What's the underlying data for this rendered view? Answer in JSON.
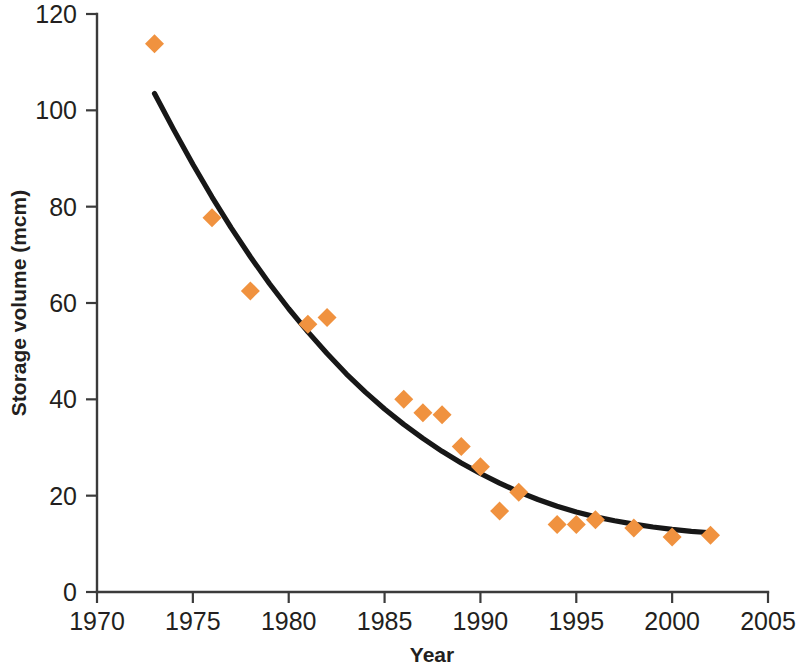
{
  "chart_data": {
    "type": "scatter",
    "title": "",
    "xlabel": "Year",
    "ylabel": "Storage volume (mcm)",
    "xlim": [
      1970,
      2005
    ],
    "ylim": [
      0,
      120
    ],
    "xticks": [
      1970,
      1975,
      1980,
      1985,
      1990,
      1995,
      2000,
      2005
    ],
    "yticks": [
      0,
      20,
      40,
      60,
      80,
      100,
      120
    ],
    "grid": false,
    "legend": null,
    "marker_shape": "diamond",
    "marker_color": "#f0923f",
    "trendline_color": "#171717",
    "series": [
      {
        "name": "Storage volume",
        "x": [
          1973,
          1976,
          1978,
          1981,
          1982,
          1986,
          1987,
          1988,
          1989,
          1990,
          1991,
          1992,
          1994,
          1995,
          1996,
          1998,
          2000,
          2002
        ],
        "values": [
          113.8,
          77.7,
          62.5,
          55.6,
          57.0,
          40.0,
          37.2,
          36.8,
          30.2,
          26.0,
          16.8,
          20.7,
          14.0,
          14.0,
          15.0,
          13.3,
          11.4,
          11.8
        ]
      }
    ],
    "trendline": {
      "name": "Exponential decay fit",
      "x": [
        1973,
        1974,
        1975,
        1976,
        1977,
        1978,
        1979,
        1980,
        1981,
        1982,
        1983,
        1984,
        1985,
        1986,
        1987,
        1988,
        1989,
        1990,
        1991,
        1992,
        1993,
        1994,
        1995,
        1996,
        1997,
        1998,
        1999,
        2000,
        2001,
        2002
      ],
      "values": [
        103.5,
        96.0,
        88.8,
        82.0,
        75.6,
        69.6,
        64.0,
        58.8,
        54.0,
        49.5,
        45.3,
        41.5,
        38.0,
        34.8,
        31.9,
        29.2,
        26.8,
        24.6,
        22.6,
        20.8,
        19.2,
        17.8,
        16.6,
        15.6,
        14.8,
        14.1,
        13.5,
        13.0,
        12.6,
        12.3
      ]
    }
  },
  "labels": {
    "y_axis_title": "Storage volume (mcm)",
    "x_axis_title": "Year",
    "y_ticks": [
      "0",
      "20",
      "40",
      "60",
      "80",
      "100",
      "120"
    ],
    "x_ticks": [
      "1970",
      "1975",
      "1980",
      "1985",
      "1990",
      "1995",
      "2000",
      "2005"
    ]
  }
}
